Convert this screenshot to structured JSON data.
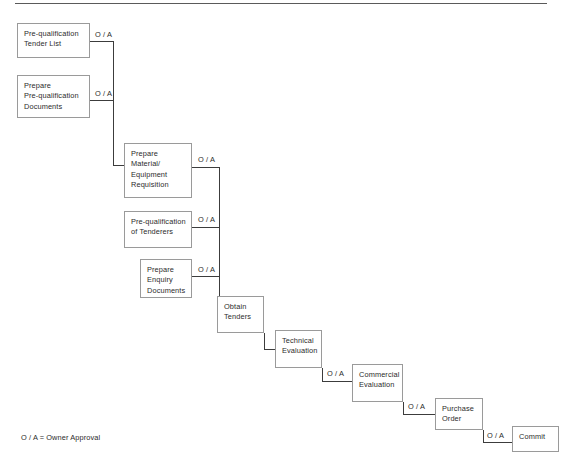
{
  "diagram": {
    "legend": "O / A = Owner Approval",
    "approval_label": "O / A",
    "colors": {
      "background": "#ffffff",
      "box_border": "#9a9a9a",
      "connector": "#3c3c3c",
      "text": "#2b2b2b",
      "rule": "#5a5a5a"
    },
    "nodes": [
      {
        "id": "pre-qualification-tender-list",
        "lines": [
          "Pre-qualification",
          "Tender List"
        ],
        "x": 17,
        "y": 23,
        "w": 73,
        "h": 35
      },
      {
        "id": "prepare-pre-qualification-documents",
        "lines": [
          "Prepare",
          "Pre-qualification",
          "Documents"
        ],
        "x": 17,
        "y": 75,
        "w": 73,
        "h": 43
      },
      {
        "id": "prepare-material-equipment-requisition",
        "lines": [
          "Prepare",
          "Material/",
          "Equipment",
          "Requisition"
        ],
        "x": 124,
        "y": 143,
        "w": 68,
        "h": 55
      },
      {
        "id": "pre-qualification-of-tenderers",
        "lines": [
          "Pre-qualification",
          "of Tenderers"
        ],
        "x": 124,
        "y": 211,
        "w": 68,
        "h": 37
      },
      {
        "id": "prepare-enquiry-documents",
        "lines": [
          "Prepare",
          "Enquiry",
          "Documents"
        ],
        "x": 140,
        "y": 259,
        "w": 52,
        "h": 39
      },
      {
        "id": "obtain-tenders",
        "lines": [
          "Obtain",
          "Tenders"
        ],
        "x": 217,
        "y": 296,
        "w": 47,
        "h": 37
      },
      {
        "id": "technical-evaluation",
        "lines": [
          "Technical",
          "Evaluation"
        ],
        "x": 275,
        "y": 330,
        "w": 47,
        "h": 38
      },
      {
        "id": "commercial-evaluation",
        "lines": [
          "Commercial",
          "Evaluation"
        ],
        "x": 352,
        "y": 364,
        "w": 51,
        "h": 38
      },
      {
        "id": "purchase-order",
        "lines": [
          "Purchase",
          "Order"
        ],
        "x": 435,
        "y": 398,
        "w": 48,
        "h": 32
      },
      {
        "id": "commit",
        "lines": [
          "Commit"
        ],
        "x": 512,
        "y": 426,
        "w": 47,
        "h": 26
      }
    ],
    "approval_labels": [
      {
        "id": "oa-tender-list",
        "text": "O / A",
        "x": 95,
        "y": 30
      },
      {
        "id": "oa-prequal-docs",
        "text": "O / A",
        "x": 95,
        "y": 89
      },
      {
        "id": "oa-requisition",
        "text": "O / A",
        "x": 198,
        "y": 155
      },
      {
        "id": "oa-tenderers",
        "text": "O / A",
        "x": 198,
        "y": 215
      },
      {
        "id": "oa-enquiry-docs",
        "text": "O / A",
        "x": 198,
        "y": 265
      },
      {
        "id": "oa-technical-eval",
        "text": "O / A",
        "x": 327,
        "y": 369
      },
      {
        "id": "oa-commercial-eval",
        "text": "O / A",
        "x": 408,
        "y": 402
      },
      {
        "id": "oa-purchase-order",
        "text": "O / A",
        "x": 487,
        "y": 431
      }
    ],
    "connectors": [
      {
        "id": "tender-list-to-trunk-a",
        "points": "90,41 113,41 113,165 124,165"
      },
      {
        "id": "prequal-docs-to-trunk-a",
        "points": "90,100 113,100"
      },
      {
        "id": "requisition-to-trunk-b",
        "points": "192,167 219,167 219,297 217,297"
      },
      {
        "id": "tenderers-to-trunk-b",
        "points": "192,227 219,227"
      },
      {
        "id": "enquiry-docs-to-trunk-b",
        "points": "192,276 219,276"
      },
      {
        "id": "obtain-to-technical",
        "points": "264,349 275,349"
      },
      {
        "id": "obtain-drop-to-technical",
        "points": "264,333 264,349"
      },
      {
        "id": "technical-to-commercial",
        "points": "322,381 352,381"
      },
      {
        "id": "technical-drop",
        "points": "322,368 322,381"
      },
      {
        "id": "commercial-to-purchase",
        "points": "403,414 435,414"
      },
      {
        "id": "commercial-drop",
        "points": "403,402 403,414"
      },
      {
        "id": "purchase-to-commit",
        "points": "483,442 512,442"
      },
      {
        "id": "purchase-drop",
        "points": "483,430 483,442"
      }
    ]
  }
}
